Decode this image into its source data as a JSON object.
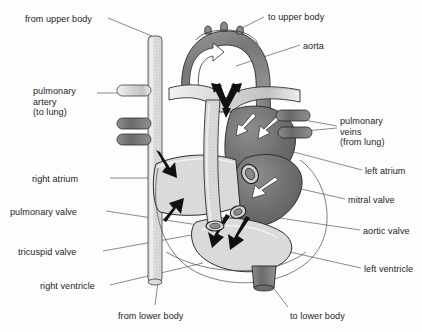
{
  "figure": {
    "type": "anatomical-diagram",
    "background_color": "#fdfdfd"
  },
  "colors": {
    "ink": "#1d1d1d",
    "leader_line": "#4a4a4a",
    "outline": "#2b2b2b",
    "oxygen_poor_dark": "#6e6e6e",
    "oxygen_rich_light": "#d8d8d8",
    "vessel_stipple": "#cfcfcf",
    "arrow_black": "#111111",
    "arrow_white": "#ffffff"
  },
  "labels": [
    {
      "id": "from-upper-body",
      "text": "from upper body",
      "x": 25,
      "y": 14,
      "align": "left"
    },
    {
      "id": "to-upper-body",
      "text": "to upper body",
      "x": 268,
      "y": 12,
      "align": "left"
    },
    {
      "id": "aorta",
      "text": "aorta",
      "x": 303,
      "y": 41,
      "align": "left"
    },
    {
      "id": "pulmonary-artery",
      "text": "pulmonary\nartery\n(to lung)",
      "x": 33,
      "y": 86,
      "align": "left"
    },
    {
      "id": "pulmonary-veins",
      "text": "pulmonary\nveins\n(from lung)",
      "x": 340,
      "y": 116,
      "align": "left"
    },
    {
      "id": "left-atrium",
      "text": "left atrium",
      "x": 365,
      "y": 166,
      "align": "left"
    },
    {
      "id": "right-atrium",
      "text": "right atrium",
      "x": 32,
      "y": 174,
      "align": "left"
    },
    {
      "id": "mitral-valve",
      "text": "mitral valve",
      "x": 348,
      "y": 195,
      "align": "left"
    },
    {
      "id": "pulmonary-valve",
      "text": "pulmonary valve",
      "x": 10,
      "y": 207,
      "align": "left"
    },
    {
      "id": "aortic-valve",
      "text": "aortic valve",
      "x": 363,
      "y": 226,
      "align": "left"
    },
    {
      "id": "tricuspid-valve",
      "text": "tricuspid valve",
      "x": 18,
      "y": 247,
      "align": "left"
    },
    {
      "id": "left-ventricle",
      "text": "left ventricle",
      "x": 364,
      "y": 264,
      "align": "left"
    },
    {
      "id": "right-ventricle",
      "text": "right ventricle",
      "x": 40,
      "y": 281,
      "align": "left"
    },
    {
      "id": "from-lower-body",
      "text": "from lower body",
      "x": 118,
      "y": 311,
      "align": "left"
    },
    {
      "id": "to-lower-body",
      "text": "to lower body",
      "x": 290,
      "y": 311,
      "align": "left"
    }
  ],
  "structures": [
    {
      "id": "superior-vena-cava",
      "name": "superior vena cava",
      "shade": "light-stipple"
    },
    {
      "id": "inferior-vena-cava",
      "name": "inferior vena cava",
      "shade": "light-stipple"
    },
    {
      "id": "aortic-arch",
      "name": "aortic arch",
      "shade": "dark"
    },
    {
      "id": "pulmonary-artery-trunk",
      "name": "pulmonary artery trunk",
      "shade": "light-stipple"
    },
    {
      "id": "pulmonary-veins",
      "name": "pulmonary veins",
      "shade": "dark"
    },
    {
      "id": "right-atrium",
      "name": "right atrium",
      "shade": "light"
    },
    {
      "id": "right-ventricle",
      "name": "right ventricle",
      "shade": "light"
    },
    {
      "id": "left-atrium",
      "name": "left atrium",
      "shade": "dark"
    },
    {
      "id": "left-ventricle",
      "name": "left ventricle",
      "shade": "light"
    },
    {
      "id": "descending-aorta",
      "name": "descending aorta",
      "shade": "dark"
    }
  ],
  "flow_arrows": [
    {
      "id": "arrow-aortic-arch",
      "color": "white",
      "note": "flow up and over the aortic arch"
    },
    {
      "id": "arrow-pulmonary-split",
      "color": "black",
      "note": "split of pulmonary trunk to both lungs"
    },
    {
      "id": "arrow-ra-inflow-upper",
      "color": "black",
      "note": "superior vena cava into right atrium"
    },
    {
      "id": "arrow-ra-inflow-lower",
      "color": "black",
      "note": "inferior vena cava into right atrium"
    },
    {
      "id": "arrow-tricuspid",
      "color": "black",
      "note": "right atrium to right ventricle"
    },
    {
      "id": "arrow-pulmonary-valve",
      "color": "black",
      "note": "right ventricle out pulmonary valve"
    },
    {
      "id": "arrow-pv-inflow-left",
      "color": "white",
      "note": "pulmonary vein into left atrium"
    },
    {
      "id": "arrow-pv-inflow-right",
      "color": "white",
      "note": "pulmonary vein into left atrium"
    },
    {
      "id": "arrow-mitral",
      "color": "white",
      "note": "left atrium to left ventricle"
    },
    {
      "id": "arrow-aortic-valve",
      "color": "white",
      "note": "left ventricle out aortic valve"
    }
  ]
}
